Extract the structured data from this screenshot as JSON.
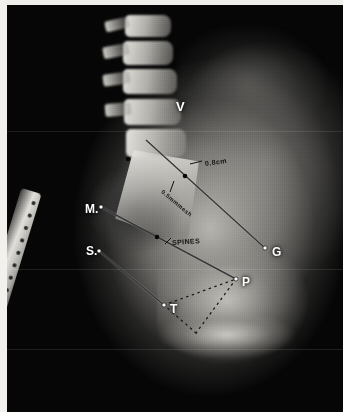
{
  "image": {
    "modality": "radiograph",
    "projection": "lateral",
    "region": "lumbosacral spine and pelvis",
    "width": 343,
    "height": 412,
    "background_color": "#000000",
    "border_color": "#f2f1ee"
  },
  "point_labels": [
    {
      "id": "V",
      "text": "V",
      "x": 176,
      "y": 100,
      "size": 13,
      "has_dot": false,
      "dot_x": 0,
      "dot_y": 0
    },
    {
      "id": "M",
      "text": "M.",
      "x": 85,
      "y": 203,
      "size": 12,
      "has_dot": true,
      "dot_x": 101,
      "dot_y": 207
    },
    {
      "id": "S",
      "text": "S.",
      "x": 86,
      "y": 245,
      "size": 12,
      "has_dot": true,
      "dot_x": 99,
      "dot_y": 251
    },
    {
      "id": "G",
      "text": "G",
      "x": 272,
      "y": 246,
      "size": 12,
      "has_dot": true,
      "dot_x": 265,
      "dot_y": 248
    },
    {
      "id": "P",
      "text": "P",
      "x": 242,
      "y": 276,
      "size": 12,
      "has_dot": true,
      "dot_x": 236,
      "dot_y": 279
    },
    {
      "id": "T",
      "text": "T",
      "x": 170,
      "y": 303,
      "size": 12,
      "has_dot": true,
      "dot_x": 164,
      "dot_y": 305
    }
  ],
  "hand_annotations": [
    {
      "id": "depth",
      "text": "0.8cm",
      "x": 205,
      "y": 160,
      "rotate": -8,
      "size": 7
    },
    {
      "id": "mesh",
      "text": "0.5mmmesh",
      "x": 162,
      "y": 188,
      "rotate": 40,
      "size": 6
    },
    {
      "id": "spines",
      "text": "SPINES",
      "x": 172,
      "y": 239,
      "rotate": -4,
      "size": 7
    }
  ],
  "measurement_lines": [
    {
      "id": "line-v-g",
      "x1": 146,
      "y1": 140,
      "x2": 266,
      "y2": 249,
      "style": "solid"
    },
    {
      "id": "line-m-p",
      "x1": 101,
      "y1": 207,
      "x2": 236,
      "y2": 279,
      "style": "solid"
    },
    {
      "id": "line-s-t",
      "x1": 99,
      "y1": 251,
      "x2": 164,
      "y2": 305,
      "style": "solid"
    }
  ],
  "leader_lines": [
    {
      "id": "leader-depth",
      "x1": 190,
      "y1": 164,
      "x2": 202,
      "y2": 161
    },
    {
      "id": "leader-mesh",
      "x1": 174,
      "y1": 181,
      "x2": 170,
      "y2": 192
    },
    {
      "id": "leader-spines",
      "x1": 165,
      "y1": 244,
      "x2": 171,
      "y2": 238
    }
  ],
  "point_markers": [
    {
      "id": "marker-upper-left",
      "x": 128,
      "y": 159
    },
    {
      "id": "marker-mid-vg",
      "x": 185,
      "y": 176
    },
    {
      "id": "marker-mid-mp",
      "x": 157,
      "y": 237
    }
  ],
  "dotted_outline": {
    "id": "dotted-triangle",
    "vertices": [
      {
        "x": 164,
        "y": 305
      },
      {
        "x": 236,
        "y": 279
      },
      {
        "x": 196,
        "y": 333
      }
    ],
    "dot_color": "#1a1a1a"
  },
  "ruler": {
    "id": "calibration-ruler",
    "tick_count": 13,
    "tick_spacing": 13,
    "rotation_deg": 17
  },
  "scan_seams": [
    126,
    264,
    344
  ]
}
